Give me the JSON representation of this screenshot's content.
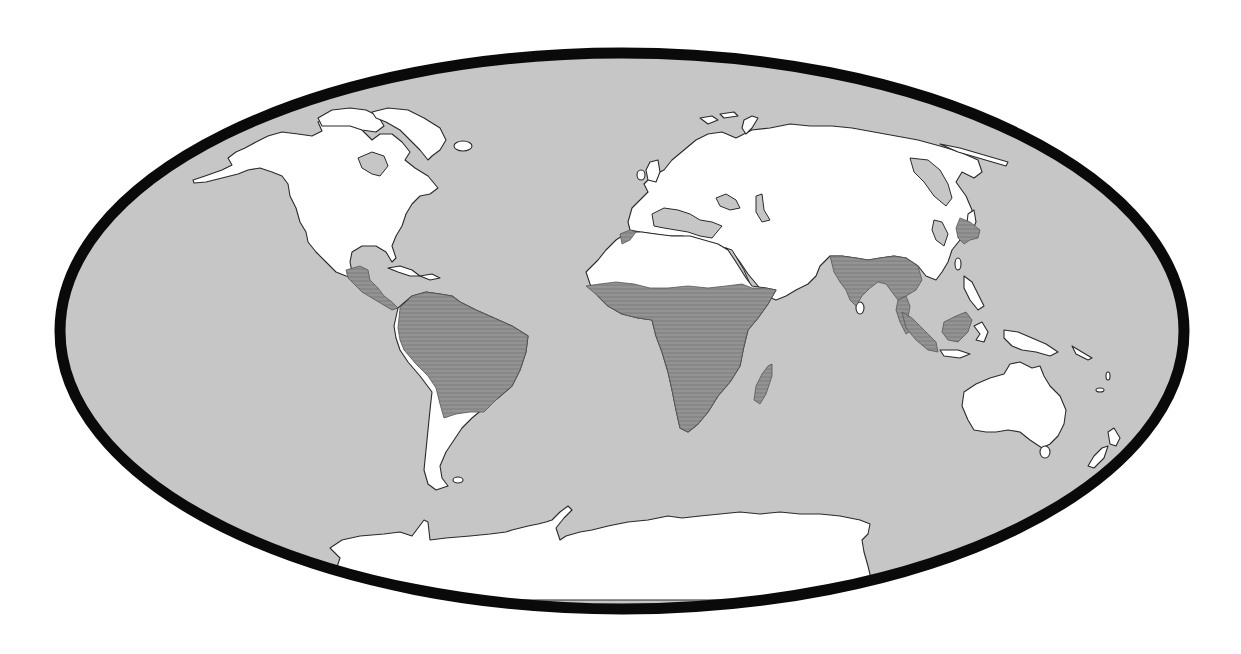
{
  "map": {
    "projection": "elliptical world map (Mollweide-like)",
    "colors": {
      "ocean": "#c6c6c6",
      "land": "#ffffff",
      "highlighted_region": "#8e8e8e",
      "hatch_line": "#7a7a7a",
      "border": "#0a0a0a",
      "coastline": "#2a2a2a",
      "background": "#ffffff"
    },
    "highlighted_regions": [
      "Central America",
      "Northern South America (Amazon basin)",
      "Sub-Saharan Africa",
      "Madagascar",
      "Indian subcontinent",
      "Southeast Asia (Indochina)",
      "Sumatra",
      "Borneo",
      "Korean peninsula"
    ],
    "landmasses": [
      "North America",
      "Greenland",
      "South America",
      "Europe",
      "Africa",
      "Asia",
      "Australia",
      "New Zealand",
      "Antarctica"
    ]
  }
}
